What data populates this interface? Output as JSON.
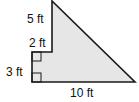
{
  "figure": {
    "fill_color": "#e6e6e6",
    "stroke_color": "#1a1a1a",
    "labels": {
      "top_vertical": "5 ft",
      "step_horizontal": "2 ft",
      "bottom_vertical": "3 ft",
      "base": "10 ft"
    }
  }
}
